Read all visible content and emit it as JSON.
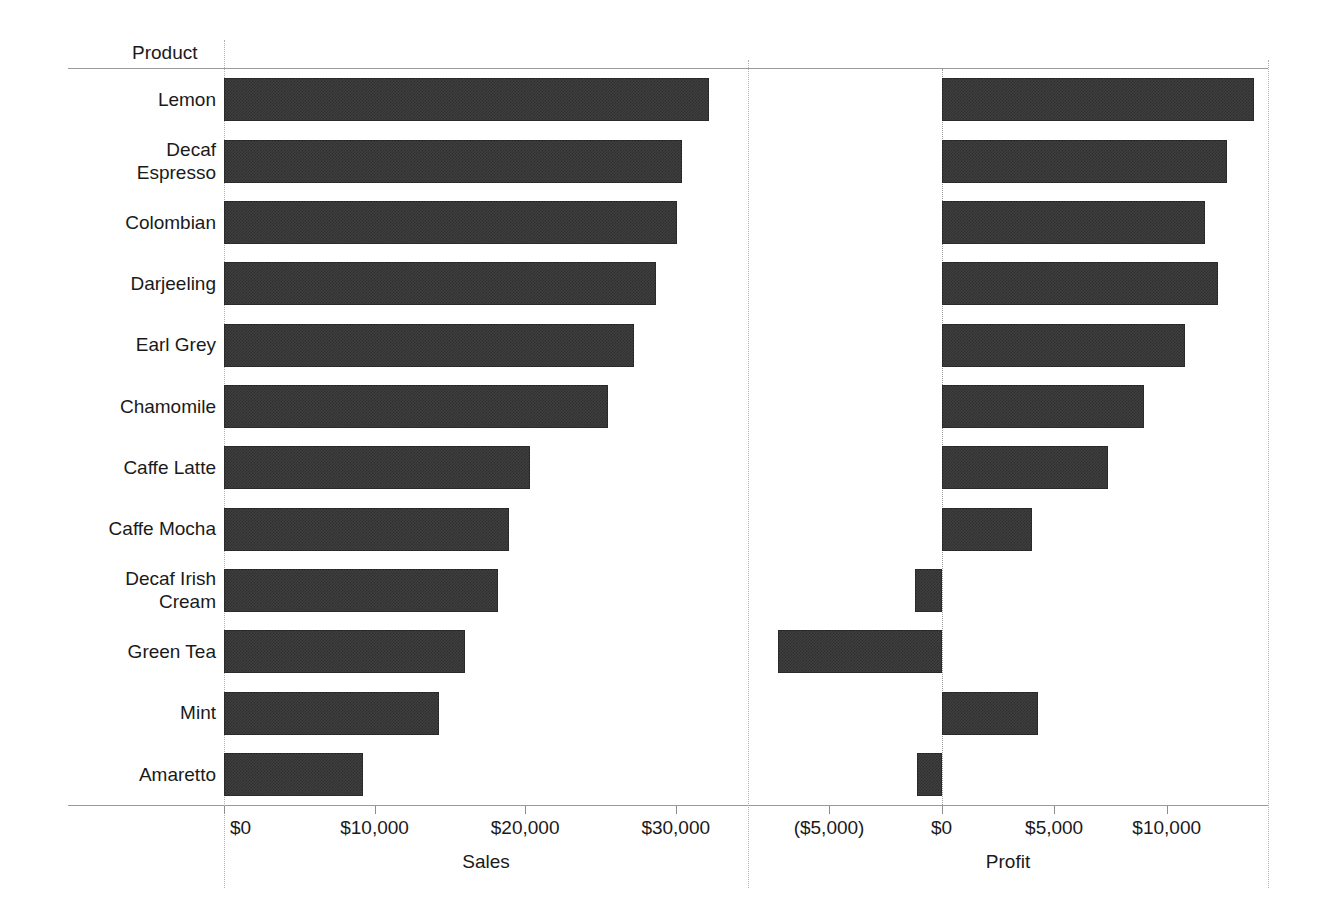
{
  "chart_data": {
    "type": "bar",
    "orientation": "horizontal",
    "title": "",
    "row_field_caption": "Product",
    "categories": [
      "Lemon",
      "Decaf Espresso",
      "Colombian",
      "Darjeeling",
      "Earl Grey",
      "Chamomile",
      "Caffe Latte",
      "Caffe Mocha",
      "Decaf Irish Cream",
      "Green Tea",
      "Mint",
      "Amaretto"
    ],
    "category_lines": [
      [
        "Lemon"
      ],
      [
        "Decaf",
        "Espresso"
      ],
      [
        "Colombian"
      ],
      [
        "Darjeeling"
      ],
      [
        "Earl Grey"
      ],
      [
        "Chamomile"
      ],
      [
        "Caffe Latte"
      ],
      [
        "Caffe Mocha"
      ],
      [
        "Decaf Irish",
        "Cream"
      ],
      [
        "Green Tea"
      ],
      [
        "Mint"
      ],
      [
        "Amaretto"
      ]
    ],
    "panels": [
      {
        "key": "sales",
        "xlabel": "Sales",
        "values": [
          32200,
          30400,
          30100,
          28700,
          27200,
          25500,
          20300,
          18900,
          18200,
          16000,
          14300,
          9200
        ],
        "xlim": [
          0,
          34800
        ],
        "ticks": [
          0,
          10000,
          20000,
          30000
        ],
        "tick_labels": [
          "$0",
          "$10,000",
          "$20,000",
          "$30,000"
        ]
      },
      {
        "key": "profit",
        "xlabel": "Profit",
        "values": [
          13900,
          12700,
          11700,
          12300,
          10800,
          9000,
          7400,
          4000,
          -1200,
          -7250,
          4300,
          -1100
        ],
        "xlim": [
          -8600,
          14500
        ],
        "ticks": [
          -5000,
          0,
          5000,
          10000
        ],
        "tick_labels": [
          "($5,000)",
          "$0",
          "$5,000",
          "$10,000"
        ]
      }
    ],
    "grid": false,
    "legend": "none",
    "bar_color": "#3f3f3f",
    "axis_color": "#9a9a9a",
    "background": "#ffffff"
  }
}
